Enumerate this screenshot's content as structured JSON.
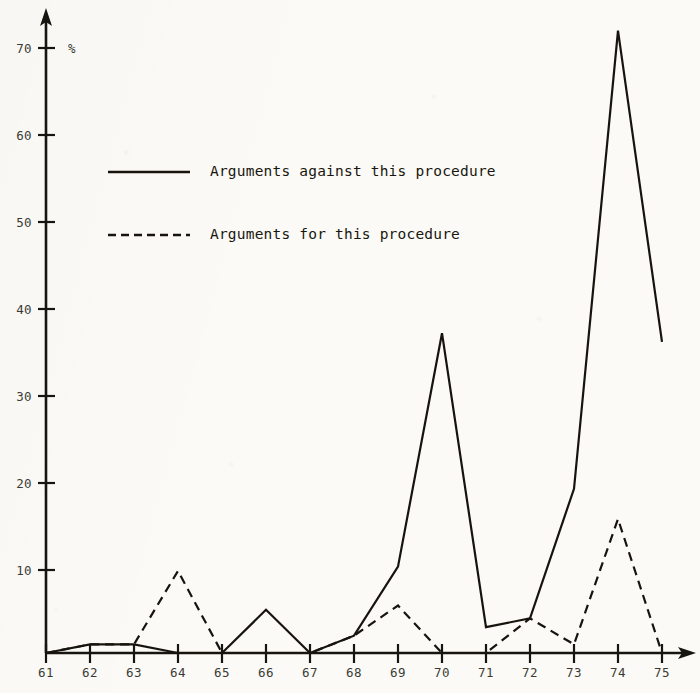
{
  "chart_data": {
    "type": "line",
    "title": "",
    "xlabel": "",
    "ylabel": "%",
    "unit_symbol": "%",
    "x": [
      "61",
      "62",
      "63",
      "64",
      "65",
      "66",
      "67",
      "68",
      "69",
      "70",
      "71",
      "72",
      "73",
      "74",
      "75"
    ],
    "categories": [
      "61",
      "62",
      "63",
      "64",
      "65",
      "66",
      "67",
      "68",
      "69",
      "70",
      "71",
      "72",
      "73",
      "74",
      "75"
    ],
    "xtick_labels": [
      "61",
      "62",
      "63",
      "64",
      "65",
      "66",
      "67",
      "68",
      "69",
      "70",
      "71",
      "72",
      "73",
      "74",
      "75"
    ],
    "ytick_labels": [
      "10",
      "20",
      "30",
      "40",
      "50",
      "60",
      "70"
    ],
    "ytick_values": [
      10,
      20,
      30,
      40,
      50,
      60,
      70
    ],
    "ylim": [
      0,
      75
    ],
    "xlim": [
      "61",
      "75"
    ],
    "grid": false,
    "legend_position": "upper-left-inside",
    "series": [
      {
        "name": "Arguments against this procedure",
        "style": "solid",
        "values": [
          0,
          1,
          1,
          0,
          0,
          5,
          0,
          2,
          10,
          37,
          3,
          4,
          19,
          72,
          36
        ]
      },
      {
        "name": "Arguments for this procedure",
        "style": "dashed",
        "values": [
          0,
          1,
          1,
          9.5,
          0,
          0,
          0,
          2,
          5.5,
          0,
          0,
          4,
          1,
          15.5,
          0
        ]
      }
    ],
    "legend": [
      {
        "label": "Arguments against this procedure",
        "style": "solid"
      },
      {
        "label": "Arguments for this procedure",
        "style": "dashed"
      }
    ],
    "axis_color": "#17150f",
    "line_color": "#17140e",
    "background_color": "#fbfaf6"
  },
  "page": {
    "corner_mark": ""
  }
}
